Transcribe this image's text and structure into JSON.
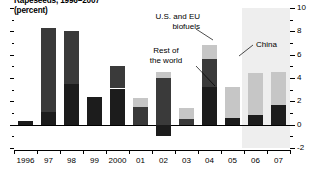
{
  "title": {
    "line1": "Rapeseeds, 1996–2007",
    "line2": "(percent)"
  },
  "annotations": {
    "biofuels": {
      "line1": "U.S. and EU",
      "line2": "biofuels"
    },
    "china": {
      "line1": "China"
    },
    "rest": {
      "line1": "Rest of",
      "line2": "the world"
    }
  },
  "axis": {
    "y_labels": [
      "10",
      "8",
      "6",
      "4",
      "2",
      "0",
      "-2"
    ],
    "x_labels": [
      "1996",
      "97",
      "98",
      "99",
      "2000",
      "01",
      "02",
      "03",
      "04",
      "05",
      "06",
      "07"
    ]
  },
  "colors": {
    "china": "#3a3a3a",
    "rest_of_world": "#1c1c1c",
    "biofuels": "#c6c6c6",
    "forecast_band": "#eeeeee",
    "axis": "#000000"
  },
  "chart_data": {
    "type": "bar",
    "title": "Rapeseeds, 1996–2007 (percent)",
    "xlabel": "",
    "ylabel": "percent",
    "ylim": [
      -2,
      10
    ],
    "grid": false,
    "stacked": true,
    "legend": "annotations",
    "categories": [
      "1996",
      "97",
      "98",
      "99",
      "2000",
      "01",
      "02",
      "03",
      "04",
      "05",
      "06",
      "07"
    ],
    "series": [
      {
        "name": "Rest of the world",
        "color": "#1c1c1c",
        "values": [
          0.35,
          1.1,
          3.5,
          2.4,
          3.1,
          0.0,
          -1.0,
          0.0,
          3.2,
          0.6,
          0.8,
          1.7
        ]
      },
      {
        "name": "China",
        "color": "#3a3a3a",
        "values": [
          0.0,
          7.2,
          4.5,
          0.0,
          1.9,
          1.5,
          4.0,
          0.5,
          2.4,
          0.0,
          0.0,
          0.0
        ]
      },
      {
        "name": "U.S. and EU biofuels",
        "color": "#c6c6c6",
        "values": [
          0.0,
          0.0,
          0.0,
          0.0,
          0.0,
          0.8,
          0.5,
          0.9,
          1.2,
          2.6,
          3.6,
          2.8
        ]
      }
    ],
    "forecast_from": "06"
  }
}
